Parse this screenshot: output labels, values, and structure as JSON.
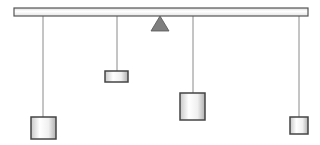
{
  "diagram": {
    "type": "balance-beam-mobile",
    "background": "#ffffff",
    "beam": {
      "x1": 14,
      "x2": 308,
      "y": 8,
      "height": 8,
      "fill": "#f4f4f4",
      "stroke": "#555555"
    },
    "fulcrum": {
      "apex_x": 160,
      "apex_y": 16,
      "base_y": 31,
      "half_width": 9,
      "fill": "#7f7f7f",
      "stroke": "#555555"
    },
    "weights": [
      {
        "id": "weight-1",
        "rod_x": 43,
        "x": 31,
        "y": 117,
        "w": 25,
        "h": 22
      },
      {
        "id": "weight-2",
        "rod_x": 117,
        "x": 105,
        "y": 71,
        "w": 23,
        "h": 11
      },
      {
        "id": "weight-3",
        "rod_x": 193,
        "x": 180,
        "y": 93,
        "w": 25,
        "h": 27
      },
      {
        "id": "weight-4",
        "rod_x": 299,
        "x": 290,
        "y": 117,
        "w": 18,
        "h": 17
      }
    ],
    "rod_color": "#8a8a8a",
    "weight_stroke": "#444444"
  }
}
